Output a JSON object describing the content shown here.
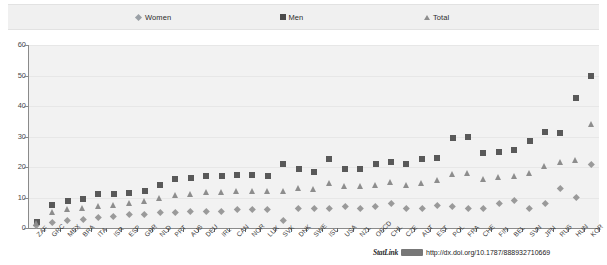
{
  "legend": {
    "position": "top",
    "items": [
      {
        "label": "Women",
        "marker": "diamond-marker-icon",
        "color": "#9aa0a6"
      },
      {
        "label": "Men",
        "marker": "square-marker-icon",
        "color": "#4a4a4a"
      },
      {
        "label": "Total",
        "marker": "triangle-marker-icon",
        "color": "#8e8e8e"
      }
    ]
  },
  "statlink": {
    "word": "StatLink",
    "badge": "statlink-barcode-icon",
    "url": "http://dx.doi.org/10.1787/888932710669"
  },
  "chart_data": {
    "type": "scatter",
    "title": "",
    "xlabel": "",
    "ylabel": "",
    "ylim": [
      0,
      60
    ],
    "yticks": [
      0,
      10,
      20,
      30,
      40,
      50,
      60
    ],
    "grid": true,
    "legend_position": "top",
    "categories": [
      "ZAF",
      "GRC",
      "MEX",
      "BRA",
      "ITA",
      "ISR",
      "ESP",
      "GBR",
      "NLD",
      "PRT",
      "AUS",
      "DEU",
      "IRL",
      "CAN",
      "NOR",
      "LUX",
      "SVK",
      "DNK",
      "SWE",
      "ISL",
      "USA",
      "NZL",
      "OECD",
      "CHL",
      "CZE",
      "AUT",
      "EST",
      "POL",
      "FRA",
      "CHE",
      "FIN",
      "BEL",
      "SVN",
      "JPN",
      "RUS",
      "HUN",
      "KOR"
    ],
    "series": [
      {
        "name": "Women",
        "marker": "diamond",
        "color": "#9a9a9a",
        "values": [
          1.0,
          2.0,
          2.5,
          3.0,
          3.5,
          4.0,
          4.5,
          4.5,
          5.0,
          5.0,
          5.5,
          5.5,
          5.5,
          6.0,
          6.0,
          6.0,
          2.5,
          6.5,
          6.5,
          6.5,
          7.0,
          6.5,
          7.0,
          8.0,
          6.5,
          6.5,
          7.5,
          7.0,
          6.5,
          6.5,
          8.0,
          9.0,
          6.5,
          8.0,
          13.0,
          10.0,
          21.0
        ]
      },
      {
        "name": "Men",
        "marker": "square",
        "color": "#595959",
        "values": [
          2.0,
          7.5,
          9.0,
          9.5,
          11.0,
          11.0,
          11.5,
          12.0,
          14.0,
          16.0,
          16.5,
          17.0,
          17.0,
          17.5,
          17.5,
          17.0,
          21.0,
          19.5,
          18.5,
          22.5,
          19.5,
          19.5,
          21.0,
          21.5,
          21.0,
          22.5,
          23.0,
          29.5,
          30.0,
          24.5,
          25.0,
          25.5,
          28.5,
          31.5,
          31.0,
          42.5,
          50.0
        ]
      },
      {
        "name": "Total",
        "marker": "triangle",
        "color": "#8d8d8d",
        "values": [
          1.5,
          5.0,
          6.0,
          6.5,
          7.0,
          7.5,
          8.0,
          8.5,
          9.5,
          10.5,
          11.0,
          11.5,
          11.5,
          12.0,
          12.0,
          12.0,
          12.0,
          13.0,
          12.5,
          14.5,
          13.5,
          13.5,
          14.0,
          15.0,
          14.0,
          14.5,
          15.5,
          17.5,
          18.0,
          16.0,
          16.5,
          17.0,
          18.0,
          20.0,
          21.5,
          22.0,
          34.0
        ]
      }
    ]
  }
}
